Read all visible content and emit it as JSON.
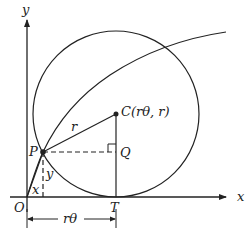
{
  "diagram": {
    "colors": {
      "stroke": "#222222",
      "background": "#ffffff"
    },
    "labels": {
      "y_axis": "y",
      "x_axis": "x",
      "origin": "O",
      "point_p": "P",
      "point_c": "C(rθ, r)",
      "point_q": "Q",
      "point_t": "T",
      "radius": "r",
      "seg_x": "x",
      "seg_y": "y",
      "arc_length": "rθ"
    },
    "geometry": {
      "origin": [
        27,
        197
      ],
      "P": [
        43,
        152
      ],
      "C": [
        116,
        114
      ],
      "Q": [
        116,
        152
      ],
      "T": [
        116,
        197
      ],
      "circle_radius": 83
    }
  }
}
